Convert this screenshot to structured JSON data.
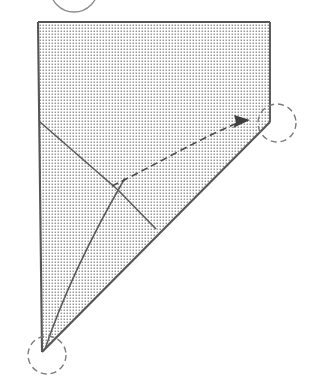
{
  "figure": {
    "type": "geometric-fold-instruction",
    "canvas": {
      "width": 314,
      "height": 382
    },
    "background_color": "#ffffff"
  },
  "colors": {
    "outline": "#555555",
    "stipple_dot": "#6e6e6e",
    "paper_fill": "#ffffff",
    "crease_line": "#5a5a5a",
    "arc_line": "#5a5a5a",
    "arrow_line": "#4a4a4a",
    "dashed_circle": "#7a7a7a",
    "solid_circle": "#8a8a8a"
  },
  "shapes": {
    "paper_polygon": {
      "name": "shaded-paper-triangle",
      "points": "38,22 270,22 270,122 42,352",
      "description": "Stippled quadrilateral paper sheet occupying upper-left of frame"
    },
    "edges": [
      {
        "name": "top-edge",
        "from": [
          38,
          22
        ],
        "to": [
          270,
          22
        ]
      },
      {
        "name": "right-edge",
        "from": [
          270,
          22
        ],
        "to": [
          270,
          122
        ]
      },
      {
        "name": "hypotenuse-edge",
        "from": [
          270,
          122
        ],
        "to": [
          42,
          352
        ]
      },
      {
        "name": "left-edge",
        "from": [
          38,
          22
        ],
        "to": [
          42,
          352
        ]
      }
    ],
    "creases": [
      {
        "name": "upper-crease",
        "from": [
          40,
          122
        ],
        "to": [
          118,
          190
        ],
        "style": "solid"
      },
      {
        "name": "lower-crease",
        "from": [
          118,
          190
        ],
        "to": [
          156,
          229
        ],
        "style": "solid"
      }
    ],
    "arc": {
      "name": "fold-arc",
      "description": "Curved arc sweeping from bottom vertex up through crossing point toward right vertex",
      "path": "M 44,352 C 66,286 96,228 125,178",
      "style": "solid"
    },
    "arrow": {
      "name": "fold-direction-arrow",
      "description": "Dashed curved arrow pointing right toward the highlighted corner",
      "path": "M 112,186 C 150,168 200,138 240,122",
      "head_at": [
        247,
        121
      ],
      "head_angle_deg": -12,
      "style": "dashed"
    },
    "markers": [
      {
        "name": "corner-marker-right",
        "kind": "dashed-circle",
        "center": [
          277,
          123
        ],
        "radius": 19
      },
      {
        "name": "corner-marker-bottom",
        "kind": "dashed-circle",
        "center": [
          47,
          355
        ],
        "radius": 19
      },
      {
        "name": "corner-marker-top-cropped",
        "kind": "solid-circle",
        "center": [
          74,
          -12
        ],
        "radius": 24,
        "note": "partially cropped by top edge of frame"
      }
    ]
  },
  "labels": {
    "caption": "",
    "annotations": []
  }
}
